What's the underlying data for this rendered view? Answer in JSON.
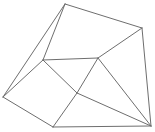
{
  "diagram": {
    "type": "planar-graph",
    "stroke_color": "#6e6e6e",
    "background": "#ffffff",
    "vertices": [
      {
        "id": "top",
        "x": 65,
        "y": 4
      },
      {
        "id": "top-right",
        "x": 142,
        "y": 28
      },
      {
        "id": "left",
        "x": 3,
        "y": 97
      },
      {
        "id": "bottom-left",
        "x": 53,
        "y": 127
      },
      {
        "id": "bottom-right",
        "x": 151,
        "y": 126
      },
      {
        "id": "inner-left",
        "x": 43,
        "y": 60
      },
      {
        "id": "inner-right",
        "x": 98,
        "y": 58
      },
      {
        "id": "inner-bottom",
        "x": 77,
        "y": 93
      }
    ],
    "edges": [
      [
        "top",
        "top-right"
      ],
      [
        "top",
        "left"
      ],
      [
        "top",
        "inner-left"
      ],
      [
        "top-right",
        "bottom-right"
      ],
      [
        "top-right",
        "inner-right"
      ],
      [
        "inner-left",
        "inner-right"
      ],
      [
        "inner-left",
        "left"
      ],
      [
        "inner-left",
        "inner-bottom"
      ],
      [
        "inner-right",
        "inner-bottom"
      ],
      [
        "inner-right",
        "bottom-right"
      ],
      [
        "left",
        "bottom-left"
      ],
      [
        "bottom-left",
        "bottom-right"
      ],
      [
        "bottom-left",
        "inner-bottom"
      ],
      [
        "inner-bottom",
        "bottom-right"
      ]
    ]
  }
}
